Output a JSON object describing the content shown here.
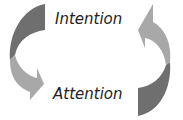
{
  "diagram": {
    "top_label": "Intention",
    "bottom_label": "Attention",
    "colors": {
      "arrow_dark": "#6f6f6f",
      "arrow_light": "#a8a8a8",
      "text": "#222222"
    }
  }
}
